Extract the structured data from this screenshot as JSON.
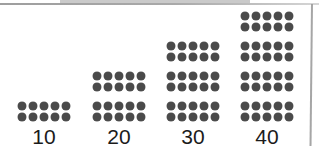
{
  "figure": {
    "title": ""
  },
  "chart_data": {
    "type": "bar",
    "title": "",
    "subtitle": "",
    "xlabel": "",
    "ylabel": "",
    "categories": [
      "10",
      "20",
      "30",
      "40"
    ],
    "values": [
      10,
      20,
      30,
      40
    ],
    "tick_labels": [
      "10",
      "20",
      "30",
      "40"
    ],
    "legend": [],
    "annotations": [],
    "grid": false,
    "legend_position": "none",
    "ylim": [
      0,
      40
    ],
    "unit_per_block": 10,
    "block_rows": 2,
    "block_columns": 5,
    "blocks_per_category": [
      1,
      2,
      3,
      4
    ],
    "dots_per_category": [
      10,
      20,
      30,
      40
    ],
    "dot_color": "#4a4a4a",
    "label_color": "#1b1b1b",
    "background_color": "#ffffff",
    "frame_color": "#9c9c9c"
  },
  "groups": [
    {
      "label": "10",
      "blocks": 1,
      "dots": 10,
      "left": 7
    },
    {
      "label": "20",
      "blocks": 2,
      "dots": 20,
      "left": 82
    },
    {
      "label": "30",
      "blocks": 3,
      "dots": 30,
      "left": 156
    },
    {
      "label": "40",
      "blocks": 4,
      "dots": 40,
      "left": 230
    }
  ]
}
